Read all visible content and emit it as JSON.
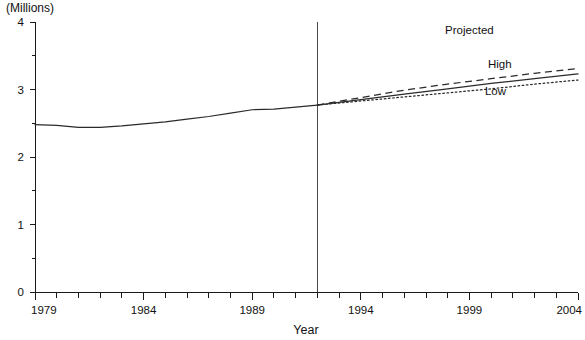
{
  "chart_data": {
    "type": "line",
    "title": "",
    "xlabel": "Year",
    "ylabel": "(Millions)",
    "xlim": [
      1979,
      2004
    ],
    "ylim": [
      0,
      4
    ],
    "grid": false,
    "legend_position": "inline-annotations",
    "x_tick_labels": [
      "1979",
      "1984",
      "1989",
      "1994",
      "1999",
      "2004"
    ],
    "x_tick_values": [
      1979,
      1984,
      1989,
      1994,
      1999,
      2004
    ],
    "x_minor_tick_step": 1,
    "y_tick_labels": [
      "0",
      "1",
      "2",
      "3",
      "4"
    ],
    "y_tick_values": [
      0,
      1,
      2,
      3,
      4
    ],
    "y_minor_tick_step": 0.5,
    "projection_start_year": 1992,
    "annotations": [
      {
        "text": "Projected",
        "x": 1999.0,
        "y": 3.83
      },
      {
        "text": "High",
        "x": 2000.4,
        "y": 3.32
      },
      {
        "text": "Low",
        "x": 2000.2,
        "y": 2.92
      }
    ],
    "x": [
      1979,
      1980,
      1981,
      1982,
      1983,
      1984,
      1985,
      1986,
      1987,
      1988,
      1989,
      1990,
      1991,
      1992
    ],
    "series": [
      {
        "name": "Historical",
        "style": "solid",
        "x": [
          1979,
          1980,
          1981,
          1982,
          1983,
          1984,
          1985,
          1986,
          1987,
          1988,
          1989,
          1990,
          1991,
          1992
        ],
        "values": [
          2.48,
          2.47,
          2.44,
          2.44,
          2.46,
          2.49,
          2.52,
          2.56,
          2.6,
          2.65,
          2.7,
          2.71,
          2.74,
          2.77
        ]
      },
      {
        "name": "High",
        "style": "dashed",
        "x": [
          1992,
          1994,
          1996,
          1998,
          2000,
          2002,
          2004
        ],
        "values": [
          2.77,
          2.88,
          2.99,
          3.08,
          3.16,
          3.24,
          3.31
        ]
      },
      {
        "name": "Middle",
        "style": "solid",
        "x": [
          1992,
          1994,
          1996,
          1998,
          2000,
          2002,
          2004
        ],
        "values": [
          2.77,
          2.85,
          2.93,
          3.01,
          3.09,
          3.16,
          3.23
        ]
      },
      {
        "name": "Low",
        "style": "dotted",
        "x": [
          1992,
          1994,
          1996,
          1998,
          2000,
          2002,
          2004
        ],
        "values": [
          2.77,
          2.83,
          2.89,
          2.95,
          3.01,
          3.08,
          3.14
        ]
      }
    ]
  },
  "labels": {
    "y_unit": "(Millions)",
    "x_axis_title": "Year"
  }
}
